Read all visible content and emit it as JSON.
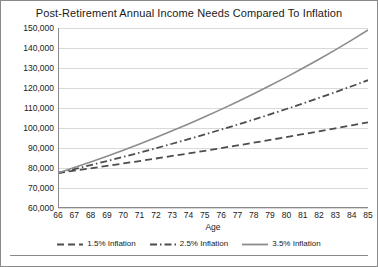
{
  "chart_data": {
    "type": "line",
    "title": "Post-Retirement Annual Income Needs Compared To Inflation",
    "xlabel": "Age",
    "ylabel": "Annual Income Distribution",
    "x": [
      66,
      67,
      68,
      69,
      70,
      71,
      72,
      73,
      74,
      75,
      76,
      77,
      78,
      79,
      80,
      81,
      82,
      83,
      84,
      85
    ],
    "xlim": [
      66,
      85
    ],
    "ylim": [
      60000,
      150000
    ],
    "ytick_labels": [
      "150,000",
      "140,000",
      "130,000",
      "120,000",
      "110,000",
      "100,000",
      "90,000",
      "80,000",
      "70,000",
      "60,000"
    ],
    "yticks": [
      150000,
      140000,
      130000,
      120000,
      110000,
      100000,
      90000,
      80000,
      70000,
      60000
    ],
    "grid": "horizontal",
    "legend_position": "bottom",
    "series": [
      {
        "name": "1.5% Inflation",
        "style": "dashed",
        "color": "#4d4d4d",
        "values": [
          77500,
          78663,
          79843,
          81040,
          82256,
          83490,
          84742,
          86013,
          87304,
          88613,
          89942,
          91291,
          92661,
          94051,
          95461,
          96893,
          98347,
          99822,
          101319,
          102839
        ]
      },
      {
        "name": "2.5% Inflation",
        "style": "dash-dot",
        "color": "#4d4d4d",
        "values": [
          77500,
          79438,
          81423,
          83459,
          85545,
          87684,
          89876,
          92123,
          94426,
          96787,
          99206,
          101687,
          104229,
          106835,
          109506,
          112243,
          115049,
          117925,
          120873,
          123895
        ]
      },
      {
        "name": "3.5% Inflation",
        "style": "solid",
        "color": "#8c8c8c",
        "values": [
          77500,
          80213,
          83020,
          85926,
          88933,
          92046,
          95267,
          98602,
          102053,
          105625,
          109322,
          113148,
          117108,
          121207,
          125449,
          129840,
          134384,
          139088,
          143956,
          148995
        ]
      }
    ]
  }
}
